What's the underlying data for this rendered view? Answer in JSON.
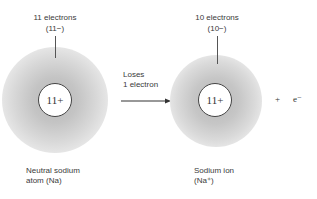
{
  "neutral_atom": {
    "electron_count_label": "11 electrons",
    "electron_charge_label": "(11−)",
    "nucleus_label": "11+",
    "caption_line1": "Neutral sodium",
    "caption_line2": "atom (Na)"
  },
  "process": {
    "line1": "Loses",
    "line2": "1 electron",
    "arrow_icon": "right-arrow-icon"
  },
  "ion": {
    "electron_count_label": "10 electrons",
    "electron_charge_label": "(10−)",
    "nucleus_label": "11+",
    "caption_line1": "Sodium ion",
    "caption_line2": "(Na⁺)"
  },
  "products": {
    "plus": "+",
    "electron": "e⁻"
  },
  "colors": {
    "cloud": "#c0c0c0",
    "nucleus_border": "#444444",
    "text": "#3a3a3a"
  }
}
